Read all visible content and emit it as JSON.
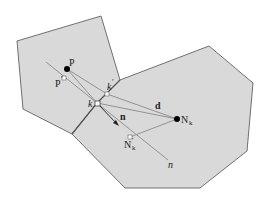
{
  "diagram": {
    "type": "geometric-construction",
    "colors": {
      "cell_fill": "#d9d9d9",
      "cell_stroke": "#707070",
      "line": "#8a8a8a",
      "point_filled": "#000000",
      "point_hollow": "#ffffff"
    },
    "labels": {
      "P": "P",
      "P_prime": "P",
      "P_prime_mark": "′",
      "k_prime": "k",
      "k_prime_mark": "′",
      "k": "k",
      "d": "d",
      "n_vec": "n",
      "N_k": "N",
      "N_k_sub": "k",
      "N_k_prime": "N",
      "N_k_prime_sub": "k",
      "N_k_prime_mark": "′",
      "n_line": "n"
    },
    "points": {
      "P": [
        67,
        69
      ],
      "P_prime": [
        64,
        78
      ],
      "k_prime": [
        107,
        94
      ],
      "k": [
        97,
        103
      ],
      "N_k": [
        177,
        119
      ],
      "N_k_prime": [
        130,
        137
      ]
    },
    "cells": [
      {
        "name": "left-cell",
        "vertices": [
          [
            17,
            41
          ],
          [
            101,
            16
          ],
          [
            120,
            80
          ],
          [
            97,
            103
          ],
          [
            72,
            134
          ],
          [
            23,
            109
          ]
        ]
      },
      {
        "name": "right-cell",
        "vertices": [
          [
            120,
            80
          ],
          [
            209,
            46
          ],
          [
            253,
            83
          ],
          [
            247,
            151
          ],
          [
            200,
            188
          ],
          [
            125,
            188
          ],
          [
            72,
            134
          ],
          [
            97,
            103
          ]
        ]
      }
    ]
  }
}
